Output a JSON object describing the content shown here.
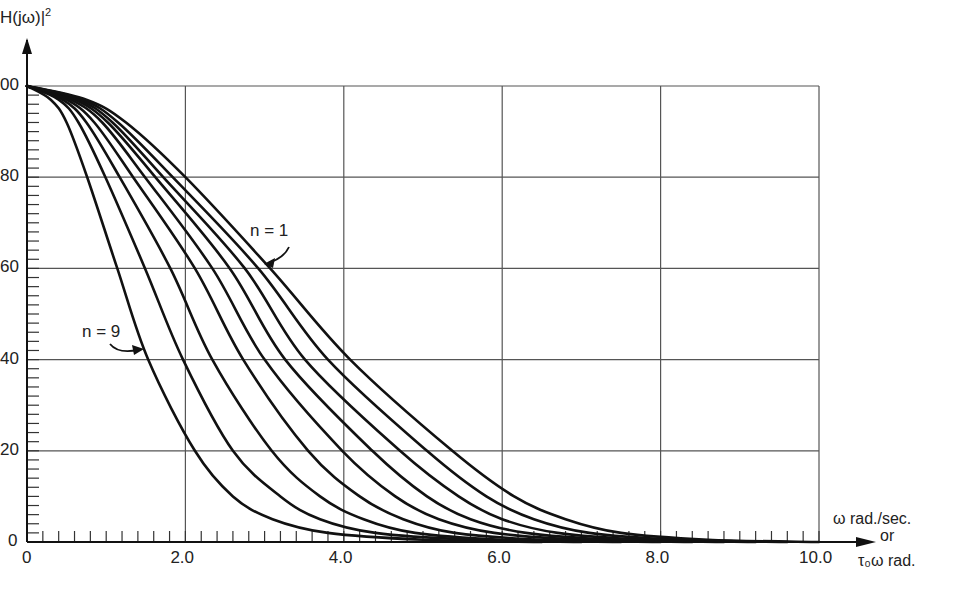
{
  "chart_data": {
    "type": "line",
    "title": "",
    "ylabel": "|H(jω)|²",
    "xlabel": "ω rad./sec. or τ₀ω rad.",
    "xlim": [
      0,
      10
    ],
    "ylim": [
      0,
      100
    ],
    "x_ticks": [
      "0",
      "2.0",
      "4.0",
      "6.0",
      "8.0",
      "10.0"
    ],
    "y_ticks": [
      "0",
      "20",
      "40",
      "60",
      "80",
      "100"
    ],
    "x_minor_step": 0.2,
    "y_minor_step": 2,
    "grid": true,
    "annotations": [
      {
        "text": "n = 1",
        "x": 2.75,
        "y": 66,
        "arrow_to": [
          3.05,
          60
        ]
      },
      {
        "text": "n = 9",
        "x": 0.95,
        "y": 44,
        "arrow_to": [
          1.5,
          41
        ]
      }
    ],
    "series": [
      {
        "name": "n = 9",
        "points": [
          [
            0,
            100
          ],
          [
            0.3,
            97
          ],
          [
            0.5,
            92
          ],
          [
            0.76,
            80
          ],
          [
            1.14,
            60
          ],
          [
            1.53,
            40
          ],
          [
            2.12,
            20
          ],
          [
            2.6,
            10
          ],
          [
            3.1,
            5
          ],
          [
            3.8,
            2
          ],
          [
            5.0,
            0.5
          ],
          [
            6.5,
            0
          ]
        ]
      },
      {
        "name": "n = 8",
        "points": [
          [
            0,
            100
          ],
          [
            0.4,
            97
          ],
          [
            0.65,
            92
          ],
          [
            0.99,
            80
          ],
          [
            1.49,
            60
          ],
          [
            1.97,
            40
          ],
          [
            2.6,
            20
          ],
          [
            3.2,
            10
          ],
          [
            3.7,
            5
          ],
          [
            4.4,
            2
          ],
          [
            5.6,
            0.5
          ],
          [
            7.0,
            0
          ]
        ]
      },
      {
        "name": "n = 7",
        "points": [
          [
            0,
            100
          ],
          [
            0.45,
            97
          ],
          [
            0.75,
            92
          ],
          [
            1.17,
            80
          ],
          [
            1.81,
            60
          ],
          [
            2.34,
            40
          ],
          [
            3.09,
            20
          ],
          [
            3.7,
            10
          ],
          [
            4.25,
            5
          ],
          [
            4.9,
            2
          ],
          [
            6.0,
            0.5
          ],
          [
            7.5,
            0
          ]
        ]
      },
      {
        "name": "n = 6",
        "points": [
          [
            0,
            100
          ],
          [
            0.5,
            97
          ],
          [
            0.85,
            92
          ],
          [
            1.34,
            80
          ],
          [
            2.12,
            60
          ],
          [
            2.73,
            40
          ],
          [
            3.55,
            20
          ],
          [
            4.2,
            10
          ],
          [
            4.75,
            5
          ],
          [
            5.4,
            2
          ],
          [
            6.5,
            0.5
          ],
          [
            8.0,
            0
          ]
        ]
      },
      {
        "name": "n = 5",
        "points": [
          [
            0,
            100
          ],
          [
            0.55,
            97
          ],
          [
            0.95,
            92
          ],
          [
            1.49,
            80
          ],
          [
            2.34,
            60
          ],
          [
            3.0,
            40
          ],
          [
            3.98,
            20
          ],
          [
            4.65,
            10
          ],
          [
            5.2,
            5
          ],
          [
            5.9,
            2
          ],
          [
            7.0,
            0.5
          ],
          [
            8.4,
            0
          ]
        ]
      },
      {
        "name": "n = 4",
        "points": [
          [
            0,
            100
          ],
          [
            0.6,
            97
          ],
          [
            1.02,
            92
          ],
          [
            1.62,
            80
          ],
          [
            2.56,
            60
          ],
          [
            3.26,
            40
          ],
          [
            4.36,
            20
          ],
          [
            5.05,
            10
          ],
          [
            5.6,
            5
          ],
          [
            6.3,
            2
          ],
          [
            7.4,
            0.5
          ],
          [
            8.8,
            0
          ]
        ]
      },
      {
        "name": "n = 3",
        "points": [
          [
            0,
            100
          ],
          [
            0.65,
            97
          ],
          [
            1.08,
            92
          ],
          [
            1.72,
            80
          ],
          [
            2.75,
            60
          ],
          [
            3.51,
            40
          ],
          [
            4.71,
            20
          ],
          [
            5.45,
            10
          ],
          [
            6.0,
            5
          ],
          [
            6.7,
            2
          ],
          [
            7.8,
            0.5
          ],
          [
            9.2,
            0
          ]
        ]
      },
      {
        "name": "n = 2",
        "points": [
          [
            0,
            100
          ],
          [
            0.7,
            97
          ],
          [
            1.15,
            92
          ],
          [
            1.84,
            80
          ],
          [
            2.92,
            60
          ],
          [
            3.8,
            40
          ],
          [
            5.05,
            20
          ],
          [
            5.8,
            10
          ],
          [
            6.4,
            5
          ],
          [
            7.1,
            2
          ],
          [
            8.2,
            0.5
          ],
          [
            9.6,
            0
          ]
        ]
      },
      {
        "name": "n = 1",
        "points": [
          [
            0,
            100
          ],
          [
            0.75,
            97
          ],
          [
            1.25,
            92
          ],
          [
            2.0,
            80
          ],
          [
            3.07,
            60
          ],
          [
            4.08,
            40
          ],
          [
            5.37,
            20
          ],
          [
            6.15,
            10
          ],
          [
            6.8,
            5
          ],
          [
            7.5,
            2
          ],
          [
            8.6,
            0.5
          ],
          [
            10.0,
            0
          ]
        ]
      }
    ]
  },
  "labels": {
    "y_title": "H(jω)|",
    "y_title_sup": "2",
    "x_unit_line1": "ω rad./sec.",
    "x_unit_line2": "or",
    "x_unit_line3": "τ₀ω rad.",
    "y_tick_visible": [
      "0",
      "20",
      "40",
      "60",
      "80",
      "00"
    ]
  }
}
